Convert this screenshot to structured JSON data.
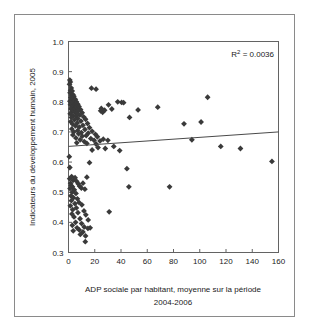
{
  "figure": {
    "background_color": "#ffffff",
    "border_color": "#8a8a8a",
    "marker_color": "#3a3a3a",
    "trendline_color": "#4a4a4a",
    "axis_color": "#636363"
  },
  "annotation": {
    "r_squared_label": "R2 = 0.0036",
    "r_squared_prefix": "R",
    "r_squared_exponent": "2",
    "r_squared_value": " = 0.0036"
  },
  "axes": {
    "x_title_line1": "ADP sociale par habitant, moyenne sur la période",
    "x_title_line2": "2004-2006",
    "y_title": "Indicateurs du développement humain, 2005",
    "x_ticks": [
      "0",
      "20",
      "40",
      "60",
      "80",
      "100",
      "120",
      "140",
      "160"
    ],
    "y_ticks": [
      "0.3",
      "0.4",
      "0.5",
      "0.6",
      "0.7",
      "0.8",
      "0.9",
      "1.0"
    ]
  },
  "chart_data": {
    "type": "scatter",
    "title": "",
    "xlabel": "ADP sociale par habitant, moyenne sur la période 2004-2006",
    "ylabel": "Indicateurs du développement humain, 2005",
    "xlim": [
      0,
      160
    ],
    "ylim": [
      0.3,
      1.0
    ],
    "xtick_values": [
      0,
      20,
      40,
      60,
      80,
      100,
      120,
      140,
      160
    ],
    "ytick_values": [
      0.3,
      0.4,
      0.5,
      0.6,
      0.7,
      0.8,
      0.9,
      1.0
    ],
    "grid": false,
    "legend": false,
    "annotations": [
      {
        "text": "R2 = 0.0036",
        "x": 142,
        "ylabel": 0.955,
        "position": "top-right"
      }
    ],
    "trendline": {
      "type": "linear",
      "r_squared": 0.0036,
      "x_start": 0,
      "y_start": 0.652,
      "x_end": 160,
      "y_end": 0.7
    },
    "series": [
      {
        "name": "Pays",
        "marker": "diamond",
        "color": "#3a3a3a",
        "points": [
          [
            1.0,
            0.872
          ],
          [
            1.4,
            0.866
          ],
          [
            0.8,
            0.858
          ],
          [
            2.1,
            0.846
          ],
          [
            1.6,
            0.838
          ],
          [
            2.8,
            0.836
          ],
          [
            1.2,
            0.83
          ],
          [
            3.4,
            0.824
          ],
          [
            2.3,
            0.82
          ],
          [
            4.1,
            0.818
          ],
          [
            1.8,
            0.814
          ],
          [
            3.0,
            0.81
          ],
          [
            5.2,
            0.808
          ],
          [
            2.6,
            0.806
          ],
          [
            4.6,
            0.804
          ],
          [
            1.1,
            0.802
          ],
          [
            6.0,
            0.8
          ],
          [
            3.7,
            0.798
          ],
          [
            2.0,
            0.796
          ],
          [
            5.5,
            0.794
          ],
          [
            7.1,
            0.792
          ],
          [
            1.5,
            0.79
          ],
          [
            4.3,
            0.788
          ],
          [
            3.2,
            0.786
          ],
          [
            8.0,
            0.784
          ],
          [
            2.4,
            0.782
          ],
          [
            6.4,
            0.78
          ],
          [
            5.0,
            0.778
          ],
          [
            1.9,
            0.776
          ],
          [
            9.2,
            0.774
          ],
          [
            3.9,
            0.772
          ],
          [
            7.5,
            0.77
          ],
          [
            2.7,
            0.768
          ],
          [
            4.8,
            0.766
          ],
          [
            10.4,
            0.764
          ],
          [
            6.1,
            0.762
          ],
          [
            1.3,
            0.76
          ],
          [
            8.6,
            0.756
          ],
          [
            3.5,
            0.754
          ],
          [
            5.8,
            0.752
          ],
          [
            11.5,
            0.75
          ],
          [
            2.2,
            0.748
          ],
          [
            7.0,
            0.744
          ],
          [
            13.0,
            0.742
          ],
          [
            4.5,
            0.74
          ],
          [
            9.5,
            0.736
          ],
          [
            1.7,
            0.734
          ],
          [
            6.7,
            0.73
          ],
          [
            14.5,
            0.728
          ],
          [
            3.1,
            0.726
          ],
          [
            11.0,
            0.722
          ],
          [
            5.3,
            0.72
          ],
          [
            8.2,
            0.716
          ],
          [
            16.0,
            0.714
          ],
          [
            2.5,
            0.71
          ],
          [
            12.5,
            0.708
          ],
          [
            6.9,
            0.704
          ],
          [
            18.0,
            0.702
          ],
          [
            4.0,
            0.7
          ],
          [
            9.8,
            0.698
          ],
          [
            15.0,
            0.696
          ],
          [
            7.7,
            0.694
          ],
          [
            20.5,
            0.692
          ],
          [
            3.3,
            0.69
          ],
          [
            13.5,
            0.688
          ],
          [
            10.5,
            0.686
          ],
          [
            22.0,
            0.684
          ],
          [
            5.6,
            0.68
          ],
          [
            17.0,
            0.678
          ],
          [
            8.9,
            0.674
          ],
          [
            19.5,
            0.672
          ],
          [
            24.0,
            0.67
          ],
          [
            12.0,
            0.668
          ],
          [
            6.3,
            0.664
          ],
          [
            21.0,
            0.66
          ],
          [
            26.5,
            0.676
          ],
          [
            14.0,
            0.662
          ],
          [
            30.0,
            0.672
          ],
          [
            17.5,
            0.845
          ],
          [
            21.0,
            0.842
          ],
          [
            24.5,
            0.77
          ],
          [
            26.0,
            0.765
          ],
          [
            25.0,
            0.778
          ],
          [
            27.5,
            0.772
          ],
          [
            30.5,
            0.79
          ],
          [
            33.0,
            0.776
          ],
          [
            37.5,
            0.8
          ],
          [
            40.5,
            0.798
          ],
          [
            42.0,
            0.797
          ],
          [
            46.5,
            0.748
          ],
          [
            53.0,
            0.773
          ],
          [
            68.0,
            0.782
          ],
          [
            88.0,
            0.727
          ],
          [
            94.0,
            0.674
          ],
          [
            101.0,
            0.733
          ],
          [
            106.0,
            0.815
          ],
          [
            116.0,
            0.652
          ],
          [
            131.0,
            0.645
          ],
          [
            18.0,
            0.64
          ],
          [
            22.5,
            0.648
          ],
          [
            28.0,
            0.645
          ],
          [
            34.5,
            0.652
          ],
          [
            39.0,
            0.638
          ],
          [
            44.5,
            0.578
          ],
          [
            31.0,
            0.435
          ],
          [
            46.0,
            0.518
          ],
          [
            77.0,
            0.518
          ],
          [
            155.0,
            0.602
          ],
          [
            0.6,
            0.618
          ],
          [
            1.0,
            0.582
          ],
          [
            2.4,
            0.552
          ],
          [
            0.9,
            0.545
          ],
          [
            3.6,
            0.54
          ],
          [
            1.6,
            0.53
          ],
          [
            5.0,
            0.548
          ],
          [
            2.0,
            0.522
          ],
          [
            6.2,
            0.536
          ],
          [
            3.0,
            0.518
          ],
          [
            7.4,
            0.528
          ],
          [
            1.2,
            0.512
          ],
          [
            4.4,
            0.508
          ],
          [
            8.5,
            0.52
          ],
          [
            2.8,
            0.5
          ],
          [
            5.7,
            0.496
          ],
          [
            9.8,
            0.514
          ],
          [
            1.8,
            0.488
          ],
          [
            11.0,
            0.53
          ],
          [
            3.8,
            0.482
          ],
          [
            6.8,
            0.478
          ],
          [
            12.5,
            0.51
          ],
          [
            2.2,
            0.472
          ],
          [
            8.0,
            0.466
          ],
          [
            14.0,
            0.55
          ],
          [
            4.9,
            0.462
          ],
          [
            10.2,
            0.458
          ],
          [
            1.4,
            0.455
          ],
          [
            6.0,
            0.448
          ],
          [
            16.0,
            0.598
          ],
          [
            3.2,
            0.442
          ],
          [
            11.8,
            0.438
          ],
          [
            7.2,
            0.432
          ],
          [
            2.6,
            0.428
          ],
          [
            13.2,
            0.425
          ],
          [
            4.2,
            0.418
          ],
          [
            8.8,
            0.412
          ],
          [
            15.0,
            0.408
          ],
          [
            5.4,
            0.4
          ],
          [
            10.0,
            0.396
          ],
          [
            2.9,
            0.39
          ],
          [
            12.0,
            0.385
          ],
          [
            6.5,
            0.382
          ],
          [
            14.8,
            0.38
          ],
          [
            8.2,
            0.375
          ],
          [
            3.6,
            0.372
          ],
          [
            11.0,
            0.368
          ],
          [
            16.5,
            0.382
          ],
          [
            9.0,
            0.36
          ],
          [
            13.0,
            0.355
          ],
          [
            12.8,
            0.336
          ]
        ]
      }
    ]
  }
}
